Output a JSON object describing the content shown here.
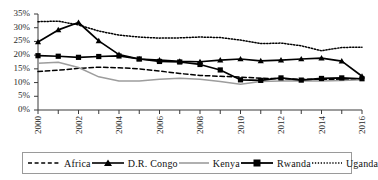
{
  "chart_data": {
    "type": "line",
    "title": "",
    "subtitle": "",
    "xlabel": "",
    "ylabel": "",
    "x": [
      2000,
      2001,
      2002,
      2003,
      2004,
      2005,
      2006,
      2007,
      2008,
      2009,
      2010,
      2011,
      2012,
      2013,
      2014,
      2015,
      2016
    ],
    "xlim": [
      2000,
      2016
    ],
    "ylim": [
      0,
      35
    ],
    "ytick_values": [
      0,
      5,
      10,
      15,
      20,
      25,
      30,
      35
    ],
    "ytick_labels": [
      "0%",
      "5%",
      "10%",
      "15%",
      "20%",
      "25%",
      "30%",
      "35%"
    ],
    "xtick_labels": [
      "2000",
      "2002",
      "2004",
      "2006",
      "2008",
      "2010",
      "2012",
      "2014",
      "2016"
    ],
    "xtick_values": [
      2000,
      2002,
      2004,
      2006,
      2008,
      2010,
      2012,
      2014,
      2016
    ],
    "grid": false,
    "legend_position": "bottom",
    "value_unit": "percent",
    "series": [
      {
        "name": "Africa",
        "style": "dashed",
        "color": "#000000",
        "marker": "none",
        "values": [
          14.0,
          14.5,
          15.2,
          15.6,
          15.4,
          15.0,
          14.2,
          13.3,
          12.6,
          12.3,
          12.0,
          11.6,
          11.4,
          11.2,
          11.2,
          11.1,
          11.3
        ]
      },
      {
        "name": "D.R. Congo",
        "style": "solid",
        "color": "#000000",
        "marker": "triangle",
        "values": [
          24.8,
          29.2,
          31.9,
          25.2,
          20.2,
          18.6,
          18.2,
          17.7,
          17.6,
          18.2,
          18.6,
          17.9,
          18.2,
          18.6,
          18.9,
          17.8,
          12.3
        ]
      },
      {
        "name": "Kenya",
        "style": "solid",
        "color": "#9d9d9d",
        "marker": "none",
        "values": [
          17.0,
          17.4,
          15.5,
          12.1,
          10.6,
          10.6,
          11.2,
          11.6,
          11.2,
          10.4,
          9.4,
          10.4,
          10.6,
          10.7,
          10.6,
          10.8,
          11.0
        ]
      },
      {
        "name": "Rwanda",
        "style": "solid",
        "color": "#000000",
        "marker": "square",
        "values": [
          19.8,
          19.6,
          19.2,
          19.5,
          19.7,
          18.6,
          17.7,
          17.5,
          16.6,
          14.6,
          11.0,
          10.8,
          11.7,
          10.9,
          11.5,
          11.7,
          11.4
        ]
      },
      {
        "name": "Uganda",
        "style": "dotted",
        "color": "#000000",
        "marker": "none",
        "values": [
          32.2,
          32.4,
          31.0,
          28.8,
          27.3,
          26.6,
          26.2,
          26.3,
          26.6,
          26.4,
          25.5,
          24.2,
          24.4,
          23.4,
          21.6,
          22.8,
          22.9
        ]
      }
    ]
  },
  "legend": {
    "items": [
      {
        "label": "Africa",
        "swatch": "dashed-line-swatch"
      },
      {
        "label": "D.R. Congo",
        "swatch": "triangle-marker-line-swatch"
      },
      {
        "label": "Kenya",
        "swatch": "gray-solid-line-swatch"
      },
      {
        "label": "Rwanda",
        "swatch": "square-marker-line-swatch"
      },
      {
        "label": "Uganda",
        "swatch": "dotted-line-swatch"
      }
    ]
  },
  "axes": {
    "y_labels": [
      "35%",
      "30%",
      "25%",
      "20%",
      "15%",
      "10%",
      "5%",
      "0%"
    ],
    "x_labels": [
      "2000",
      "2002",
      "2004",
      "2006",
      "2008",
      "2010",
      "2012",
      "2014",
      "2016"
    ]
  },
  "colors": {
    "axis": "#3a3a3a",
    "series_black": "#000000",
    "series_gray": "#9d9d9d",
    "legend_border": "#9a9a9a",
    "text": "#1a1a1a"
  }
}
